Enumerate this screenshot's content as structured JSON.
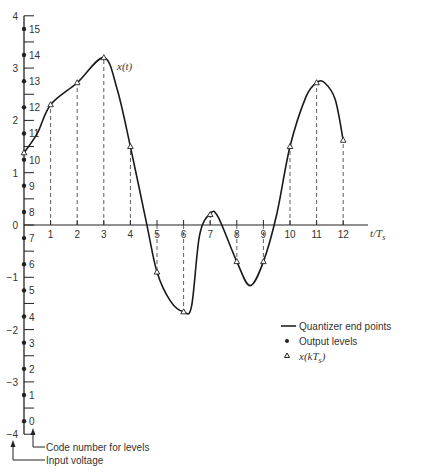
{
  "chart_data": {
    "type": "line",
    "xlabel": "t/T_s",
    "ylabel": "Input voltage",
    "xlim": [
      0,
      13
    ],
    "ylim": [
      -4,
      4
    ],
    "x_ticks": [
      1,
      2,
      3,
      4,
      5,
      6,
      7,
      8,
      9,
      10,
      11,
      12
    ],
    "y_ticks": [
      -4,
      -3,
      -2,
      -1,
      0,
      1,
      2,
      3,
      4
    ],
    "quantizer_end_points": [
      -4,
      -3.5,
      -3,
      -2.5,
      -2,
      -1.5,
      -1,
      -0.5,
      0,
      0.5,
      1,
      1.5,
      2,
      2.5,
      3,
      3.5,
      4
    ],
    "output_levels": [
      {
        "code": 0,
        "value": -3.75
      },
      {
        "code": 1,
        "value": -3.25
      },
      {
        "code": 2,
        "value": -2.75
      },
      {
        "code": 3,
        "value": -2.25
      },
      {
        "code": 4,
        "value": -1.75
      },
      {
        "code": 5,
        "value": -1.25
      },
      {
        "code": 6,
        "value": -0.75
      },
      {
        "code": 7,
        "value": -0.25
      },
      {
        "code": 8,
        "value": 0.25
      },
      {
        "code": 9,
        "value": 0.75
      },
      {
        "code": 10,
        "value": 1.25
      },
      {
        "code": 11,
        "value": 1.75
      },
      {
        "code": 12,
        "value": 2.25
      },
      {
        "code": 13,
        "value": 2.75
      },
      {
        "code": 14,
        "value": 3.25
      },
      {
        "code": 15,
        "value": 3.75
      }
    ],
    "series": [
      {
        "name": "x(kT_s)",
        "x": [
          0,
          1,
          2,
          3,
          4,
          5,
          6,
          7,
          8,
          9,
          10,
          11,
          12
        ],
        "values": [
          1.38,
          2.3,
          2.72,
          3.2,
          1.5,
          -0.9,
          -1.66,
          0.2,
          -0.7,
          -0.7,
          1.5,
          2.72,
          1.62
        ]
      }
    ],
    "curve_label": "x(t)",
    "legend": [
      "Quantizer end points",
      "Output levels",
      "x(kT_s)"
    ]
  },
  "labels": {
    "curve": "x(t)",
    "xaxis": "t/T",
    "xaxis_sub": "s",
    "code_number": "Code number for levels",
    "input_voltage": "Input voltage",
    "legend_endpoints": "Quantizer end points",
    "legend_output": "Output levels",
    "legend_sample": "x(kT",
    "legend_sample_sub": "s",
    "legend_sample_close": ")"
  }
}
